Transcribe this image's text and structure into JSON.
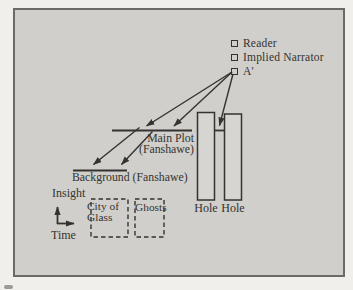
{
  "diagram": {
    "legend": {
      "items": [
        {
          "label": "Reader"
        },
        {
          "label": "Implied Narrator"
        },
        {
          "label": "A'"
        }
      ]
    },
    "plot_levels": {
      "main_plot_line1": "Main Plot",
      "main_plot_line2": "(Fanshawe)",
      "background_label": "Background (Fanshawe)"
    },
    "axes": {
      "y_axis_label": "Insight",
      "x_axis_label": "Time"
    },
    "novels": [
      {
        "lines": [
          "City of",
          "Glass"
        ]
      },
      {
        "lines": [
          "Ghosts"
        ]
      }
    ],
    "holes": [
      {
        "label": "Hole"
      },
      {
        "label": "Hole"
      }
    ],
    "colors": {
      "page_background": "#f0efeb",
      "panel_background": "#d0cfcb",
      "ink": "#35332f"
    }
  }
}
